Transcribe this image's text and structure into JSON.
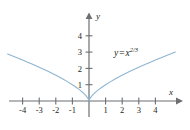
{
  "figure": {
    "background_color": "#ffffff",
    "axis_color": "#58595b",
    "text_color": "#231f20"
  },
  "labels": {
    "y_axis_name": "y",
    "x_axis_name": "x",
    "equation_base": "y = x",
    "equation_lhs": "y",
    "equation_eq": "=",
    "equation_var": "x",
    "equation_exponent": "2/3",
    "equation_full": "y = x^(2/3)"
  },
  "chart_data": {
    "type": "line",
    "title": "",
    "subtitle": "",
    "xlabel": "x",
    "ylabel": "y",
    "xlim": [
      -4.8,
      5.4
    ],
    "xlim_axis_drawn": [
      -4.8,
      5.5
    ],
    "ylim": [
      -0.8,
      5.4
    ],
    "grid": false,
    "legend": null,
    "annotations": [
      {
        "text": "y = x^(2/3)",
        "x": 1.6,
        "y": 3.2
      }
    ],
    "xticks": [
      -4,
      -3,
      -2,
      -1,
      1,
      2,
      3,
      4
    ],
    "xticklabels": [
      "-4",
      "-3",
      "-2",
      "-1",
      "1",
      "2",
      "3",
      "4"
    ],
    "yticks": [
      1,
      2,
      3,
      4
    ],
    "yticklabels": [
      "1",
      "2",
      "3",
      "4"
    ],
    "series": [
      {
        "name": "y = x^(2/3)",
        "color": "#8eb5d2",
        "linewidth": 1.1,
        "x": [
          -4.9,
          -4.6,
          -4.3,
          -4.0,
          -3.7,
          -3.4,
          -3.1,
          -2.8,
          -2.5,
          -2.2,
          -1.9,
          -1.6,
          -1.3,
          -1.0,
          -0.8,
          -0.6,
          -0.45,
          -0.3,
          -0.2,
          -0.12,
          -0.06,
          -0.02,
          0.0,
          0.02,
          0.06,
          0.12,
          0.2,
          0.3,
          0.45,
          0.6,
          0.8,
          1.0,
          1.3,
          1.6,
          1.9,
          2.2,
          2.5,
          2.8,
          3.1,
          3.4,
          3.7,
          4.0,
          4.3,
          4.6,
          4.9,
          5.2
        ],
        "y": [
          2.88,
          2.76,
          2.64,
          2.52,
          2.38,
          2.25,
          2.12,
          1.98,
          1.84,
          1.69,
          1.53,
          1.37,
          1.19,
          1.0,
          0.86,
          0.71,
          0.59,
          0.45,
          0.34,
          0.24,
          0.15,
          0.07,
          0.0,
          0.07,
          0.15,
          0.24,
          0.34,
          0.45,
          0.59,
          0.71,
          0.86,
          1.0,
          1.19,
          1.37,
          1.53,
          1.69,
          1.84,
          1.98,
          2.12,
          2.25,
          2.38,
          2.52,
          2.64,
          2.76,
          2.88,
          3.0
        ]
      }
    ]
  }
}
